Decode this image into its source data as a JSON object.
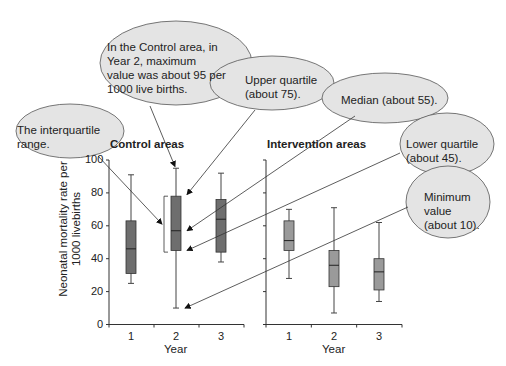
{
  "chart_data": {
    "type": "box",
    "ylabel": "Neonatal mortality rate per 1000 livebirths",
    "ylim": [
      0,
      100
    ],
    "yticks": [
      0,
      20,
      40,
      60,
      80,
      100
    ],
    "xlabel": "Year",
    "categories": [
      "1",
      "2",
      "3"
    ],
    "panels": [
      {
        "title": "Control areas",
        "boxes": [
          {
            "year": "1",
            "min": 25,
            "q1": 31,
            "median": 46,
            "q3": 63,
            "max": 91
          },
          {
            "year": "2",
            "min": 10,
            "q1": 45,
            "median": 57,
            "q3": 78,
            "max": 95
          },
          {
            "year": "3",
            "min": 38,
            "q1": 44,
            "median": 64,
            "q3": 76,
            "max": 92
          }
        ]
      },
      {
        "title": "Intervention areas",
        "boxes": [
          {
            "year": "1",
            "min": 28,
            "q1": 45,
            "median": 51,
            "q3": 63,
            "max": 70
          },
          {
            "year": "2",
            "min": 7,
            "q1": 23,
            "median": 36,
            "q3": 45,
            "max": 71
          },
          {
            "year": "3",
            "min": 14,
            "q1": 21,
            "median": 32,
            "q3": 40,
            "max": 62
          }
        ]
      }
    ],
    "annotations": [
      "The interquartile range.",
      "In the Control area, in Year 2, maximum value was about 95 per 1000 live births.",
      "Upper quartile (about 75).",
      "Median (about 55).",
      "Lower quartile (about 45).",
      "Minimum value (about 10)."
    ]
  },
  "labels": {
    "control_title": "Control areas",
    "intervention_title": "Intervention areas",
    "ylabel_line1": "Neonatal mortality rate per",
    "ylabel_line2": "1000 livebirths",
    "xlabel": "Year",
    "yticks": [
      "100",
      "80",
      "60",
      "40",
      "20",
      "0"
    ],
    "xticks": [
      "1",
      "2",
      "3"
    ]
  },
  "callouts": {
    "iqr": [
      "The interquartile",
      "range."
    ],
    "max": [
      "In the Control area, in",
      "Year 2, maximum",
      "value was about 95 per",
      "1000 live births."
    ],
    "upper": [
      "Upper quartile",
      "(about 75)."
    ],
    "median": [
      "Median (about 55)."
    ],
    "lower": [
      "Lower quartile",
      "(about 45)."
    ],
    "minimum": [
      "Minimum",
      "value",
      "(about 10)."
    ]
  },
  "colors": {
    "box_control": "#6e6e6e",
    "box_intervention": "#9a9a9a",
    "bubble_fill": "#e4e4e4",
    "line": "#333333"
  }
}
